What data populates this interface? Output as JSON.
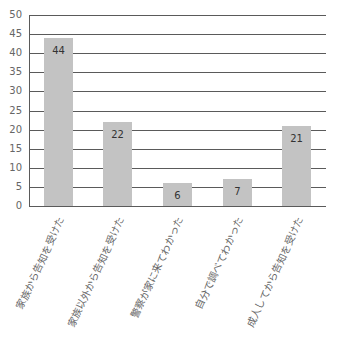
{
  "chart_data": {
    "type": "bar",
    "title": "",
    "xlabel": "",
    "ylabel": "",
    "categories": [
      "家族から告知を受けた",
      "家族以外から告知を受けた",
      "警察が家に来てわかった",
      "自分で調べてわかった",
      "成人してから告知を受けた"
    ],
    "values": [
      44,
      22,
      6,
      7,
      21
    ],
    "data_labels": [
      "44",
      "22",
      "6",
      "7",
      "21"
    ],
    "ylim": [
      0,
      50
    ],
    "yticks": [
      0,
      5,
      10,
      15,
      20,
      25,
      30,
      35,
      40,
      45,
      50
    ],
    "grid": true,
    "legend": null,
    "bar_color": "#c3c3c3",
    "grid_color": "#5a5a5a"
  }
}
